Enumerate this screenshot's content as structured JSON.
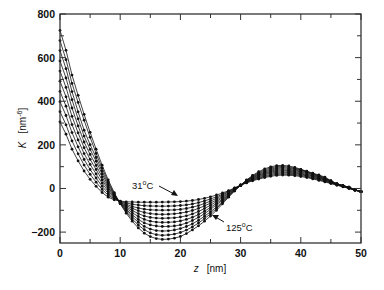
{
  "chart_data": {
    "type": "line",
    "title": "",
    "xlabel": "z  [nm]",
    "xlabel_var": "z",
    "xlabel_unit": "[nm]",
    "ylabel": "K  [nm-6]",
    "ylabel_var": "K",
    "ylabel_unit": "[nm",
    "ylabel_exp": "-6",
    "xlim": [
      0,
      50
    ],
    "ylim": [
      -250,
      800
    ],
    "xticks": [
      0,
      10,
      20,
      30,
      40,
      50
    ],
    "yticks": [
      -200,
      0,
      200,
      400,
      600,
      800
    ],
    "x_minor_step": 5,
    "y_minor_step": 100,
    "grid": false,
    "legend": null,
    "markers": "filled-circle",
    "annotations": [
      {
        "text": "31",
        "sup": "o",
        "suffix": "C",
        "label_x": 17.0,
        "label_y": -10,
        "arrow_to": [
          19.5,
          -57
        ]
      },
      {
        "text": "125",
        "sup": "o",
        "suffix": "C",
        "label_x": 27.8,
        "label_y": -190,
        "arrow_to": [
          25.4,
          -130
        ]
      }
    ],
    "series_count": 10,
    "series_range": {
      "first": "31°C",
      "last": "125°C"
    },
    "x": [
      0,
      2,
      4,
      6,
      8,
      10,
      12,
      14,
      16,
      18,
      20,
      22,
      24,
      26,
      28,
      30,
      32,
      34,
      36,
      38,
      40,
      42,
      44,
      46,
      48,
      50
    ],
    "series": [
      {
        "name": "31°C",
        "values": [
          305,
          180,
          80,
          10,
          -40,
          -58,
          -62,
          -63,
          -63,
          -62,
          -60,
          -55,
          -45,
          -30,
          -10,
          15,
          35,
          50,
          60,
          61,
          55,
          44,
          30,
          15,
          0,
          -15
        ]
      },
      {
        "name": "T2",
        "values": [
          352,
          218,
          107,
          29,
          -31,
          -59,
          -72,
          -79,
          -81,
          -81,
          -78,
          -71,
          -57,
          -38,
          -13,
          15,
          38,
          54,
          65,
          65,
          59,
          47,
          33,
          16,
          1,
          -15
        ]
      },
      {
        "name": "T3",
        "values": [
          398,
          256,
          133,
          48,
          -22,
          -60,
          -82,
          -95,
          -99,
          -99,
          -96,
          -86,
          -69,
          -45,
          -16,
          15,
          41,
          58,
          70,
          70,
          63,
          50,
          35,
          18,
          2,
          -15
        ]
      },
      {
        "name": "T4",
        "values": [
          445,
          293,
          160,
          67,
          -13,
          -62,
          -91,
          -110,
          -118,
          -118,
          -113,
          -101,
          -80,
          -53,
          -20,
          15,
          43,
          63,
          75,
          74,
          67,
          54,
          38,
          19,
          3,
          -15
        ]
      },
      {
        "name": "T5",
        "values": [
          492,
          331,
          187,
          87,
          -4,
          -63,
          -101,
          -126,
          -136,
          -136,
          -131,
          -117,
          -92,
          -60,
          -23,
          15,
          46,
          67,
          80,
          79,
          71,
          57,
          40,
          20,
          4,
          -15
        ]
      },
      {
        "name": "T6",
        "values": [
          538,
          369,
          213,
          106,
          4,
          -64,
          -111,
          -142,
          -154,
          -155,
          -149,
          -132,
          -104,
          -68,
          -27,
          15,
          49,
          71,
          85,
          83,
          76,
          60,
          42,
          21,
          4,
          -15
        ]
      },
      {
        "name": "T7",
        "values": [
          585,
          407,
          240,
          125,
          13,
          -66,
          -121,
          -158,
          -172,
          -174,
          -167,
          -147,
          -115,
          -75,
          -30,
          15,
          52,
          75,
          90,
          88,
          80,
          63,
          45,
          22,
          5,
          -15
        ]
      },
      {
        "name": "T8",
        "values": [
          632,
          444,
          267,
          142,
          22,
          -67,
          -130,
          -174,
          -193,
          -194,
          -184,
          -162,
          -127,
          -85,
          -33,
          15,
          54,
          80,
          95,
          93,
          84,
          66,
          47,
          21,
          6,
          -15
        ]
      },
      {
        "name": "T9",
        "values": [
          678,
          482,
          313,
          161,
          31,
          -69,
          -140,
          -189,
          -212,
          -213,
          -202,
          -176,
          -138,
          -92,
          -37,
          15,
          57,
          85,
          100,
          98,
          86,
          68,
          49,
          21,
          6,
          -15
        ]
      },
      {
        "name": "125°C",
        "values": [
          725,
          520,
          340,
          180,
          40,
          -70,
          -150,
          -205,
          -230,
          -232,
          -220,
          -190,
          -150,
          -100,
          -40,
          15,
          60,
          90,
          105,
          103,
          88,
          70,
          52,
          20,
          5,
          -15
        ]
      }
    ]
  }
}
